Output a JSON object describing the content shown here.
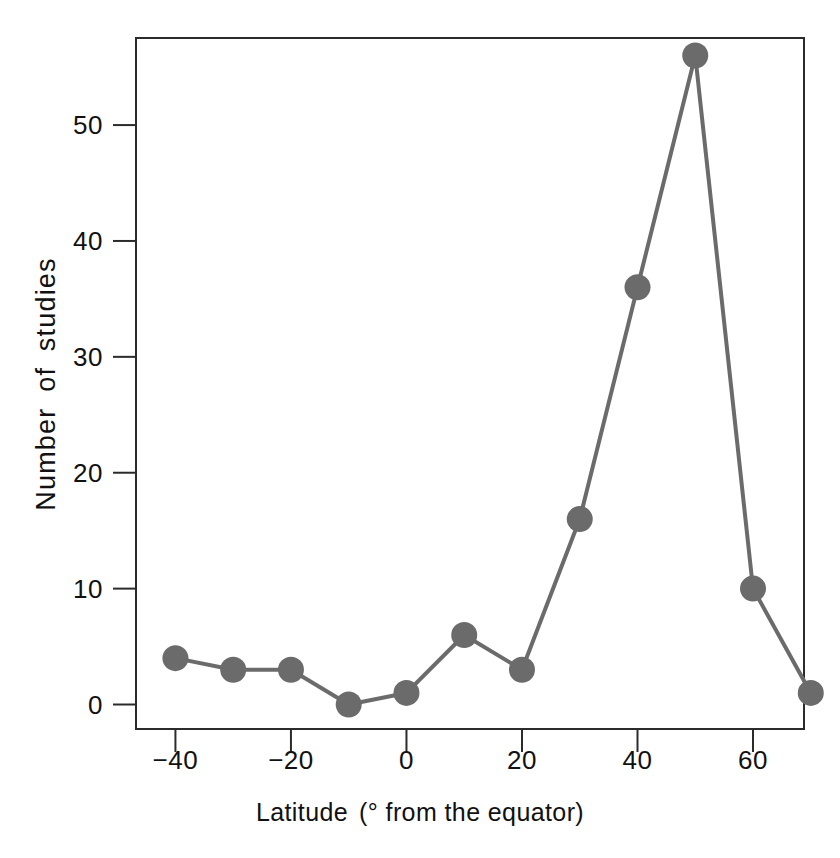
{
  "chart_data": {
    "type": "line",
    "title": "",
    "subtitle": "",
    "xlabel_main": "Latitude",
    "xlabel_paren": "(° from the equator)",
    "xlabel": "Latitude  (° from the equator)",
    "ylabel": "Number of studies",
    "x": [
      -40,
      -30,
      -20,
      -10,
      0,
      10,
      20,
      30,
      40,
      50,
      60,
      70
    ],
    "values": [
      4,
      3,
      3,
      0,
      1,
      6,
      3,
      16,
      36,
      56,
      10,
      1
    ],
    "series": [
      {
        "name": "Number of studies",
        "values": [
          4,
          3,
          3,
          0,
          1,
          6,
          3,
          16,
          36,
          56,
          10,
          1
        ]
      }
    ],
    "xlim": [
      -47,
      69
    ],
    "ylim": [
      -2.2,
      57.6
    ],
    "xticks": [
      -40,
      -20,
      0,
      20,
      40,
      60
    ],
    "xtick_labels": [
      "−40",
      "−20",
      "0",
      "20",
      "40",
      "60"
    ],
    "yticks": [
      0,
      10,
      20,
      30,
      40,
      50
    ],
    "ytick_labels": [
      "0",
      "10",
      "20",
      "30",
      "40",
      "50"
    ],
    "grid": false,
    "legend": "none",
    "marker": "filled-circle",
    "marker_size_px": 26,
    "line_width_px": 4,
    "colors": {
      "marker": "#6b6b6b",
      "line": "#6b6b6b",
      "frame": "#2b2b2b",
      "text": "#111111",
      "background": "#ffffff"
    }
  }
}
